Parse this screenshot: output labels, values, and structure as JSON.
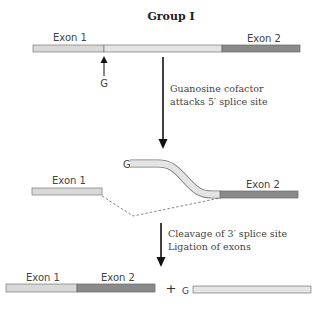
{
  "title": "Group I",
  "colors": {
    "exon1": "#d9d9d9",
    "intron": "#e4e4e4",
    "exon2": "#8a8a8a",
    "outline": "#666666",
    "arrow": "#111111",
    "text": "#444444"
  },
  "step1": {
    "exon1_label": "Exon 1",
    "exon2_label": "Exon 2",
    "g_label": "G"
  },
  "arrow1": {
    "caption_line1": "Guanosine cofactor",
    "caption_line2": "attacks 5′ splice site"
  },
  "step2": {
    "g_label": "G",
    "exon1_label": "Exon 1",
    "exon2_label": "Exon 2"
  },
  "arrow2": {
    "caption_line1": "Cleavage of 3′ splice site",
    "caption_line2": "Ligation of exons"
  },
  "step3": {
    "exon1_label": "Exon 1",
    "exon2_label": "Exon 2",
    "plus": "+",
    "g_label": "G"
  }
}
